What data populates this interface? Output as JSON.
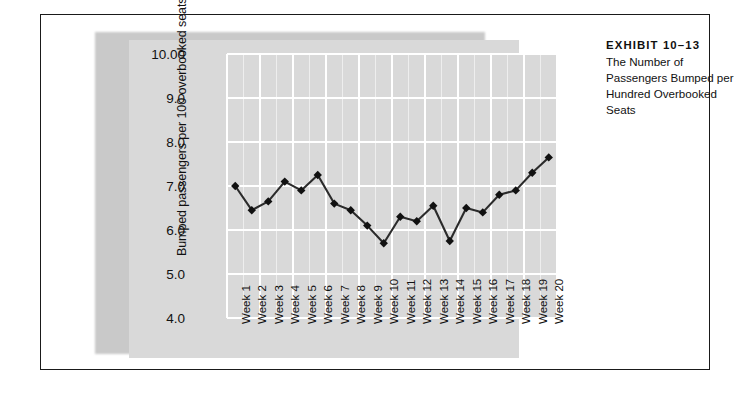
{
  "caption": {
    "exhibit_label": "EXHIBIT 10–13",
    "title": "The Number of Passengers Bumped per Hundred Overbooked Seats"
  },
  "chart_data": {
    "type": "line",
    "title": "",
    "xlabel": "",
    "ylabel": "Bumped passengers per 100 overbooked seats",
    "ylim": [
      4.0,
      10.0
    ],
    "ytick_labels": [
      "10.00",
      "9.0",
      "8.0",
      "7.0",
      "6.0",
      "5.0",
      "4.0"
    ],
    "ytick_values": [
      10.0,
      9.0,
      8.0,
      7.0,
      6.0,
      5.0,
      4.0
    ],
    "grid": true,
    "legend": "none",
    "marker": "diamond",
    "line_color": "#2b2b2b",
    "marker_color": "#111111",
    "plot_background": "#d9d9d9",
    "gridline_color": "#ffffff",
    "categories": [
      "Week 1",
      "Week 2",
      "Week 3",
      "Week 4",
      "Week 5",
      "Week 6",
      "Week 7",
      "Week 8",
      "Week 9",
      "Week 10",
      "Week 11",
      "Week 12",
      "Week 13",
      "Week 14",
      "Week 15",
      "Week 16",
      "Week 17",
      "Week 18",
      "Week 19",
      "Week 20"
    ],
    "values": [
      7.0,
      6.45,
      6.65,
      7.1,
      6.9,
      7.25,
      6.6,
      6.45,
      6.1,
      5.7,
      6.3,
      6.2,
      6.55,
      5.75,
      6.5,
      6.4,
      6.8,
      6.9,
      7.3,
      7.65
    ]
  }
}
